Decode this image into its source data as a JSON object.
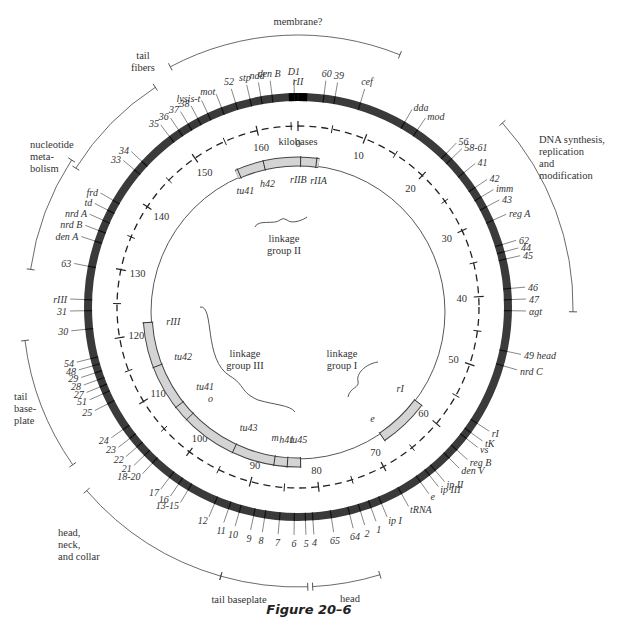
{
  "figure": {
    "caption": "Figure 20–6",
    "center_label": "kilobases",
    "scale_ticks": [
      "0",
      "10",
      "20",
      "30",
      "40",
      "50",
      "60",
      "70",
      "80",
      "90",
      "100",
      "110",
      "120",
      "130",
      "140",
      "150",
      "160"
    ]
  },
  "colors": {
    "ring": "#3a3a3a",
    "ring_marker": "#000000",
    "linkage_bar": "#d4d4d4",
    "line": "#444444"
  },
  "functional_regions": [
    {
      "label": "membrane?",
      "from_deg": -68,
      "to_deg": 57
    },
    {
      "label": "DNA synthesis, replication and modification",
      "lines": [
        "DNA synthesis,",
        "replication",
        "and",
        "modification"
      ]
    },
    {
      "label": "tail fibers",
      "lines": [
        "tail",
        "fibers"
      ]
    },
    {
      "label": "nucleotide metabolism",
      "lines": [
        "nucleotide",
        "meta-",
        "bolism"
      ]
    },
    {
      "label": "tail baseplate",
      "lines": [
        "tail",
        "base-",
        "plate"
      ]
    },
    {
      "label": "head, neck, and collar",
      "lines": [
        "head,",
        "neck,",
        "and collar"
      ]
    },
    {
      "label": "tail baseplate (bottom)",
      "lines": [
        "tail baseplate"
      ]
    },
    {
      "label": "head (bottom)",
      "lines": [
        "head"
      ]
    }
  ],
  "genes": [
    {
      "label": "rII",
      "deg": 0
    },
    {
      "label": "D1",
      "deg": -1
    },
    {
      "label": "den B",
      "deg": -7
    },
    {
      "label": "ndd",
      "deg": -10
    },
    {
      "label": "stp",
      "deg": -13
    },
    {
      "label": "52",
      "deg": -17
    },
    {
      "label": "mot",
      "deg": -21
    },
    {
      "label": "lysis-t",
      "deg": -25
    },
    {
      "label": "38",
      "deg": -28
    },
    {
      "label": "37",
      "deg": -31
    },
    {
      "label": "36",
      "deg": -34
    },
    {
      "label": "35",
      "deg": -37
    },
    {
      "label": "34",
      "deg": -47
    },
    {
      "label": "33",
      "deg": -50
    },
    {
      "label": "frd",
      "deg": -60
    },
    {
      "label": "td",
      "deg": -63
    },
    {
      "label": "nrd A",
      "deg": -66
    },
    {
      "label": "nrd B",
      "deg": -69
    },
    {
      "label": "den A",
      "deg": -72
    },
    {
      "label": "63",
      "deg": -79
    },
    {
      "label": "rIII",
      "deg": -88
    },
    {
      "label": "31",
      "deg": -91
    },
    {
      "label": "30",
      "deg": -96
    },
    {
      "label": "54",
      "deg": -104
    },
    {
      "label": "48",
      "deg": -106
    },
    {
      "label": "29",
      "deg": -108
    },
    {
      "label": "28",
      "deg": -110
    },
    {
      "label": "27",
      "deg": -112
    },
    {
      "label": "51",
      "deg": -114
    },
    {
      "label": "25",
      "deg": -117
    },
    {
      "label": "24",
      "deg": -125
    },
    {
      "label": "23",
      "deg": -128
    },
    {
      "label": "22",
      "deg": -131
    },
    {
      "label": "21",
      "deg": -134
    },
    {
      "label": "18-20",
      "deg": -137
    },
    {
      "label": "17",
      "deg": -143
    },
    {
      "label": "16",
      "deg": -146
    },
    {
      "label": "13-15",
      "deg": -149
    },
    {
      "label": "12",
      "deg": -157
    },
    {
      "label": "11",
      "deg": -161
    },
    {
      "label": "10",
      "deg": -164
    },
    {
      "label": "9",
      "deg": -168
    },
    {
      "label": "8",
      "deg": -171
    },
    {
      "label": "7",
      "deg": -175
    },
    {
      "label": "6",
      "deg": -179
    },
    {
      "label": "5",
      "deg": 178
    },
    {
      "label": "4",
      "deg": 176
    },
    {
      "label": "65",
      "deg": 171
    },
    {
      "label": "64",
      "deg": 166
    },
    {
      "label": "2",
      "deg": 163
    },
    {
      "label": "1",
      "deg": 160
    },
    {
      "label": "ip I",
      "deg": 157
    },
    {
      "label": "tRNA",
      "deg": 151
    },
    {
      "label": "e",
      "deg": 145
    },
    {
      "label": "ip III",
      "deg": 142
    },
    {
      "label": "ip II",
      "deg": 140
    },
    {
      "label": "den V",
      "deg": 135
    },
    {
      "label": "reg B",
      "deg": 132
    },
    {
      "label": "vs",
      "deg": 128
    },
    {
      "label": "tK",
      "deg": 126
    },
    {
      "label": "rI",
      "deg": 123
    },
    {
      "label": "nrd C",
      "deg": 106
    },
    {
      "label": "49 head",
      "deg": 102
    },
    {
      "label": "αgt",
      "deg": 91
    },
    {
      "label": "47",
      "deg": 88
    },
    {
      "label": "46",
      "deg": 85
    },
    {
      "label": "45",
      "deg": 77
    },
    {
      "label": "44",
      "deg": 75
    },
    {
      "label": "62",
      "deg": 73
    },
    {
      "label": "reg A",
      "deg": 66
    },
    {
      "label": "43",
      "deg": 62
    },
    {
      "label": "imm",
      "deg": 59
    },
    {
      "label": "42",
      "deg": 56
    },
    {
      "label": "41",
      "deg": 51
    },
    {
      "label": "58-61",
      "deg": 46
    },
    {
      "label": "56",
      "deg": 44
    },
    {
      "label": "mod",
      "deg": 34
    },
    {
      "label": "dda",
      "deg": 30
    },
    {
      "label": "cef",
      "deg": 17
    },
    {
      "label": "39",
      "deg": 10
    },
    {
      "label": "60",
      "deg": 7
    }
  ],
  "linkage_groups": [
    {
      "label_lines": [
        "linkage",
        "group II"
      ],
      "markers": [
        "tu41",
        "h42",
        "rIIB",
        "rIIA"
      ]
    },
    {
      "label_lines": [
        "linkage",
        "group III"
      ],
      "markers": [
        "rIII",
        "tu42",
        "tu41",
        "o",
        "tu43",
        "m",
        "h41",
        "tu45"
      ]
    },
    {
      "label_lines": [
        "linkage",
        "group I"
      ],
      "markers": [
        "rI",
        "e"
      ]
    }
  ]
}
